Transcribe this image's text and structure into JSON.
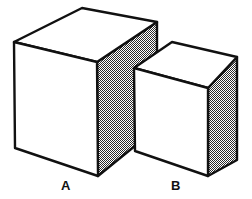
{
  "figure": {
    "background_color": "#ffffff",
    "stroke_color": "#111111",
    "face_fill_color": "#ffffff",
    "shaded_face_pattern": "stipple-checker",
    "shaded_face_color": "#8c8c8c",
    "line_width": 2.4
  },
  "labels": {
    "a": "A",
    "b": "B"
  },
  "shapes": [
    {
      "name": "block-a",
      "label": "A",
      "size": "large",
      "faces": {
        "top": {
          "name": "top-face",
          "fill": "white",
          "points": "14,42 82,8 157,22 97,62"
        },
        "left": {
          "name": "front-left-face",
          "fill": "white",
          "points": "14,42 97,62 98,176 15,148"
        },
        "right": {
          "name": "right-shaded-face",
          "fill": "stipple",
          "points": "97,62 157,22 157,128 98,176"
        }
      },
      "vertices": {
        "top_left": [
          14,
          42
        ],
        "top_back": [
          82,
          8
        ],
        "top_right": [
          157,
          22
        ],
        "top_front": [
          97,
          62
        ],
        "bottom_left": [
          15,
          148
        ],
        "bottom_front": [
          98,
          176
        ],
        "bottom_right": [
          157,
          128
        ]
      }
    },
    {
      "name": "block-b",
      "label": "B",
      "size": "small",
      "faces": {
        "top": {
          "name": "top-face",
          "fill": "white",
          "points": "134,68 172,42 237,57 208,88"
        },
        "left": {
          "name": "front-left-face",
          "fill": "white",
          "points": "134,68 208,88 208,176 135,151"
        },
        "right": {
          "name": "right-shaded-face",
          "fill": "stipple",
          "points": "208,88 237,57 237,160 208,176"
        }
      },
      "vertices": {
        "top_left": [
          134,
          68
        ],
        "top_back": [
          172,
          42
        ],
        "top_right": [
          237,
          57
        ],
        "top_front": [
          208,
          88
        ],
        "bottom_left": [
          135,
          151
        ],
        "bottom_front": [
          208,
          176
        ],
        "bottom_right": [
          237,
          160
        ]
      }
    }
  ]
}
